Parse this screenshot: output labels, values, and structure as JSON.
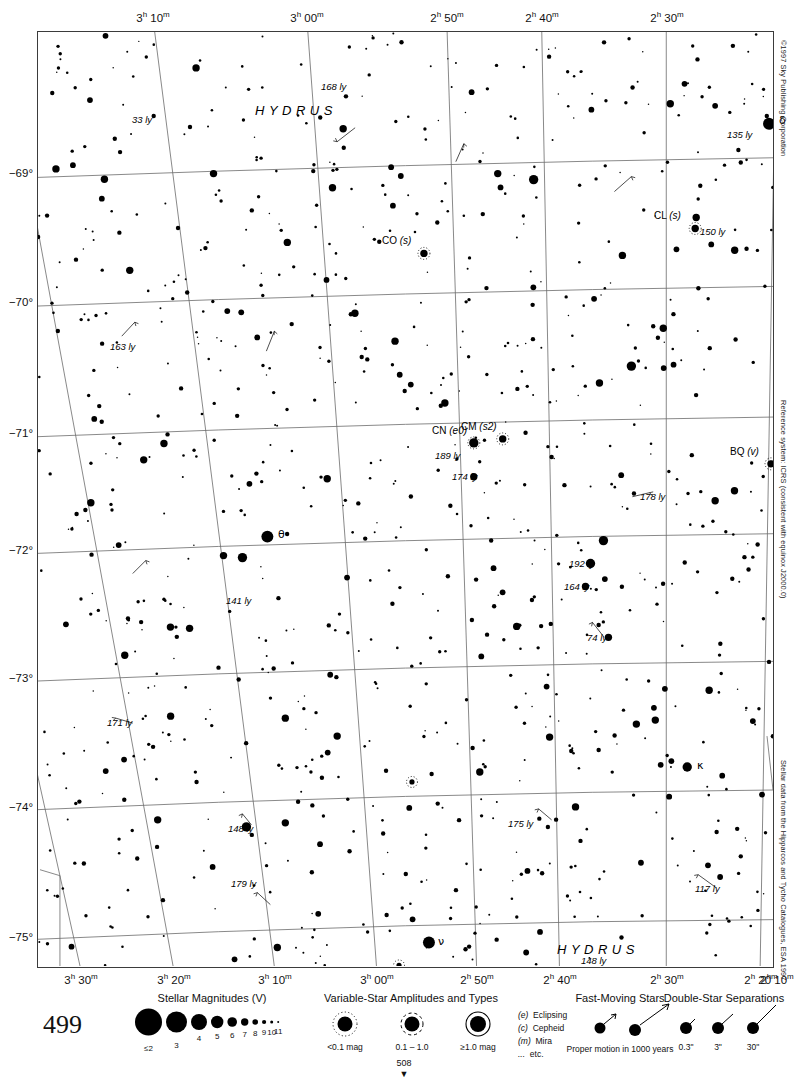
{
  "page": {
    "page_number": "499",
    "fold_number": "508",
    "top_crop_text": "",
    "copyright": "©1997 Sky Publishing Corporation",
    "reference_note": "Reference system: ICRS (consistent with equinox J2000.0)",
    "data_source_note": "Stellar data from the Hipparcos and Tycho Catalogues, ESA 1997"
  },
  "chart_data": {
    "type": "scatter",
    "xlabel": "Right Ascension",
    "ylabel": "Declination",
    "grid": true,
    "ra_ticks_top": [
      "3h 10m",
      "3h 00m",
      "2h 50m",
      "2h 40m",
      "2h 30m",
      "2h 20m"
    ],
    "ra_ticks_bottom": [
      "3h 30m",
      "3h 20m",
      "3h 10m",
      "3h 00m",
      "2h 50m",
      "2h 40m",
      "2h 30m",
      "2h 20m",
      "2h 10m"
    ],
    "ra_ticks": [
      {
        "h": "3",
        "m": "30",
        "x_top": -168,
        "x_bot": 44
      },
      {
        "h": "3",
        "m": "20",
        "x_top": -38,
        "x_bot": 137
      },
      {
        "h": "3",
        "m": "10",
        "x_top": 116,
        "x_bot": 238
      },
      {
        "h": "3",
        "m": "00",
        "x_top": 270,
        "x_bot": 340
      },
      {
        "h": "2",
        "m": "50",
        "x_top": 410,
        "x_bot": 440
      },
      {
        "h": "2",
        "m": "40",
        "x_top": 505,
        "x_bot": 523
      },
      {
        "h": "2",
        "m": "30",
        "x_top": 630,
        "x_bot": 630
      },
      {
        "h": "2",
        "m": "20",
        "x_top": 740,
        "x_bot": 724
      },
      {
        "h": "2",
        "m": "10",
        "x_top": 880,
        "x_bot": 740
      }
    ],
    "dec_ticks": [
      {
        "label": "−69°",
        "y": 142
      },
      {
        "label": "−70°",
        "y": 271
      },
      {
        "label": "−71°",
        "y": 402
      },
      {
        "label": "−72°",
        "y": 519
      },
      {
        "label": "−73°",
        "y": 647
      },
      {
        "label": "−74°",
        "y": 776
      },
      {
        "label": "−75°",
        "y": 906
      }
    ],
    "dec_range": [
      -75.5,
      -68.4
    ],
    "ra_range_hours": [
      2.1,
      3.55
    ],
    "constellation_labels": [
      {
        "text": "HYDRUS",
        "x": 218,
        "y": 72
      },
      {
        "text": "HYDRUS",
        "x": 520,
        "y": 911
      }
    ],
    "named_stars": [
      {
        "label": "δ",
        "x": 733,
        "y": 92,
        "mag": 2.8,
        "distance_ly": "135 ly",
        "dist_x": 712,
        "dist_y": 104
      },
      {
        "label": "θ",
        "x": 232,
        "y": 506,
        "mag": 3.0
      },
      {
        "label": "κ",
        "x": 651,
        "y": 737,
        "mag": 3.4
      },
      {
        "label": "ν",
        "x": 392,
        "y": 913,
        "mag": 3.2
      }
    ],
    "variable_stars": [
      {
        "label": "CL",
        "type": "(s)",
        "x": 659,
        "y": 197,
        "distance_ly": "150 ly"
      },
      {
        "label": "CO",
        "type": "(s)",
        "x": 387,
        "y": 222
      },
      {
        "label": "CN",
        "type": "(e0)",
        "x": 437,
        "y": 412,
        "distance_ly": "189 ly"
      },
      {
        "label": "CM",
        "type": "(s2)",
        "x": 466,
        "y": 408
      },
      {
        "label": "BQ",
        "type": "(v)",
        "x": 735,
        "y": 433
      }
    ],
    "distance_annotations": [
      {
        "text": "168 ly",
        "x": 306,
        "y": 56
      },
      {
        "text": "33 ly",
        "x": 117,
        "y": 89
      },
      {
        "text": "135 ly",
        "x": 712,
        "y": 104
      },
      {
        "text": "150 ly",
        "x": 685,
        "y": 201
      },
      {
        "text": "163 ly",
        "x": 95,
        "y": 316
      },
      {
        "text": "189 ly",
        "x": 420,
        "y": 425
      },
      {
        "text": "174 ly",
        "x": 437,
        "y": 446
      },
      {
        "text": "178 ly",
        "x": 625,
        "y": 466
      },
      {
        "text": "141 ly",
        "x": 211,
        "y": 570
      },
      {
        "text": "192 ly",
        "x": 554,
        "y": 533
      },
      {
        "text": "164 ly",
        "x": 549,
        "y": 556
      },
      {
        "text": "74 ly",
        "x": 572,
        "y": 607
      },
      {
        "text": "171 ly",
        "x": 92,
        "y": 692
      },
      {
        "text": "175 ly",
        "x": 493,
        "y": 793
      },
      {
        "text": "117 ly",
        "x": 680,
        "y": 858
      },
      {
        "text": "148 ly",
        "x": 213,
        "y": 798
      },
      {
        "text": "179 ly",
        "x": 216,
        "y": 853
      },
      {
        "text": "148 ly",
        "x": 566,
        "y": 930
      }
    ]
  },
  "legend": {
    "magnitudes": {
      "title": "Stellar Magnitudes (V)",
      "labels": [
        "≤2",
        "3",
        "4",
        "5",
        "6",
        "7",
        "8",
        "9",
        "10",
        "11"
      ],
      "radii": [
        13.5,
        10.5,
        8.0,
        6.2,
        4.8,
        3.7,
        2.8,
        2.1,
        1.5,
        1.0
      ]
    },
    "variables": {
      "title": "Variable-Star Amplitudes and Types",
      "amplitude_labels": [
        "<0.1 mag",
        "0.1 – 1.0",
        "≥1.0 mag"
      ],
      "types": [
        {
          "code": "(e)",
          "name": "Eclipsing"
        },
        {
          "code": "(c)",
          "name": "Cepheid"
        },
        {
          "code": "(m)",
          "name": "Mira"
        },
        {
          "code": "...",
          "name": "etc."
        }
      ]
    },
    "fast_moving": {
      "title": "Fast-Moving Stars",
      "caption": "Proper motion in 1000 years"
    },
    "doubles": {
      "title": "Double-Star Separations",
      "labels": [
        "0.3ʺ",
        "3ʺ",
        "30ʺ"
      ]
    }
  }
}
